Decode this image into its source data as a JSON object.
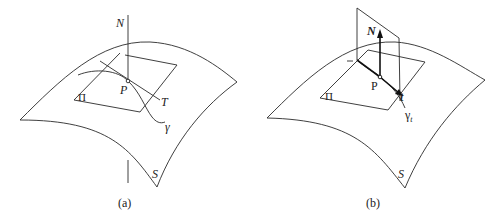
{
  "panels": [
    {
      "id": "a",
      "caption": "(a)",
      "labels": {
        "normal": "N",
        "point": "P",
        "tangent": "T",
        "curve": "γ",
        "plane": "Π",
        "surface": "S"
      }
    },
    {
      "id": "b",
      "caption": "(b)",
      "labels": {
        "normal": "N",
        "point": "P",
        "tangent": "t",
        "curve": "γ",
        "curve_subscript": "t",
        "plane": "Π",
        "surface": "S"
      }
    }
  ],
  "colors": {
    "line": "#2a2a2a",
    "background": "#ffffff"
  }
}
